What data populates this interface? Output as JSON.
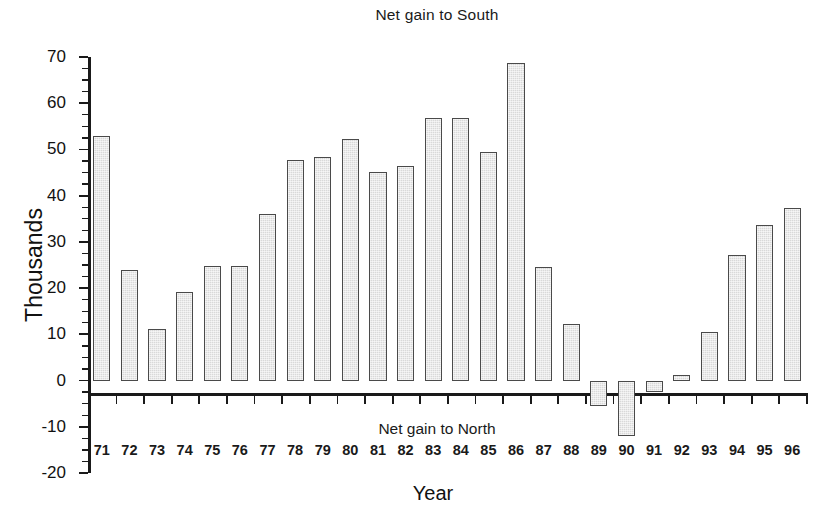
{
  "chart_data": {
    "type": "bar",
    "title": "Net gain to South",
    "xlabel": "Year",
    "ylabel": "Thousands",
    "annotations": [
      {
        "text": "Net gain to South",
        "position": "top-center"
      },
      {
        "text": "Net gain to North",
        "position": "below-zero-axis-center"
      }
    ],
    "categories": [
      "71",
      "72",
      "73",
      "74",
      "75",
      "76",
      "77",
      "78",
      "79",
      "80",
      "81",
      "82",
      "83",
      "84",
      "85",
      "86",
      "87",
      "88",
      "89",
      "90",
      "91",
      "92",
      "93",
      "94",
      "95",
      "96"
    ],
    "values": [
      52.9,
      24.0,
      11.2,
      19.2,
      24.8,
      24.8,
      36.1,
      47.8,
      48.3,
      52.3,
      45.2,
      46.5,
      56.8,
      56.8,
      49.4,
      68.7,
      24.5,
      12.2,
      -5.4,
      -12.0,
      -2.5,
      1.3,
      10.5,
      27.2,
      33.6,
      37.3
    ],
    "ylim": [
      -20,
      70
    ],
    "ytick_step": 10,
    "yticks": [
      70,
      60,
      50,
      40,
      30,
      20,
      10,
      0,
      -10,
      -20
    ],
    "ytick_labels": [
      "70",
      "60",
      "50",
      "40",
      "30",
      "20",
      "10",
      "0",
      "-10",
      "-20"
    ],
    "minor_tick_step": 2.5,
    "grid": false,
    "legend": "none",
    "bar_fill_color": "#d9d9d9",
    "bar_edge_color": "#4a4a4a",
    "axis_color": "#1a1a1a",
    "background_color": "#ffffff"
  },
  "labels": {
    "title": "Net gain to South",
    "north_note": "Net gain to North",
    "y_axis_title": "Thousands",
    "x_axis_title": "Year"
  }
}
